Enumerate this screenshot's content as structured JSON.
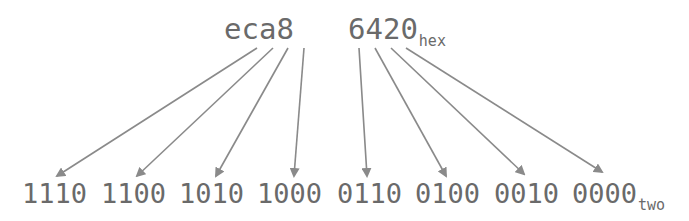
{
  "hex_value": {
    "high_digits": "eca8",
    "low_digits": "6420",
    "suffix": "hex"
  },
  "binary_value": {
    "nibbles": [
      "1110",
      "1100",
      "1010",
      "1000",
      "0110",
      "0100",
      "0010",
      "0000"
    ],
    "suffix": "two"
  },
  "colors": {
    "text": "#6a6a6a",
    "arrow": "#8a8a8a",
    "background": "#ffffff"
  },
  "mapping": [
    {
      "from": "e",
      "to": "1110"
    },
    {
      "from": "c",
      "to": "1100"
    },
    {
      "from": "a",
      "to": "1010"
    },
    {
      "from": "8",
      "to": "1000"
    },
    {
      "from": "6",
      "to": "0110"
    },
    {
      "from": "4",
      "to": "0100"
    },
    {
      "from": "2",
      "to": "0010"
    },
    {
      "from": "0",
      "to": "0000"
    }
  ]
}
